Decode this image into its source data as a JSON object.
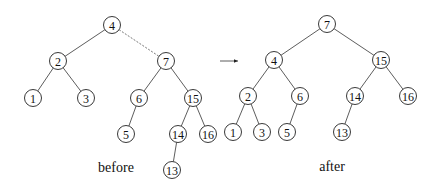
{
  "figure": {
    "node_radius": 8.5,
    "trees": [
      {
        "id": "before",
        "caption": "before",
        "caption_pos": [
          116,
          172
        ],
        "nodes": [
          {
            "key": "4",
            "x": 112,
            "y": 25
          },
          {
            "key": "2",
            "x": 58,
            "y": 61
          },
          {
            "key": "7",
            "x": 166,
            "y": 61
          },
          {
            "key": "1",
            "x": 33,
            "y": 98
          },
          {
            "key": "3",
            "x": 86,
            "y": 98
          },
          {
            "key": "6",
            "x": 139,
            "y": 98
          },
          {
            "key": "15",
            "x": 193,
            "y": 98
          },
          {
            "key": "5",
            "x": 126,
            "y": 134
          },
          {
            "key": "14",
            "x": 178,
            "y": 134
          },
          {
            "key": "16",
            "x": 208,
            "y": 134
          },
          {
            "key": "13",
            "x": 172,
            "y": 170
          }
        ],
        "edges": [
          {
            "from": "4",
            "to": "2",
            "style": "solid"
          },
          {
            "from": "4",
            "to": "7",
            "style": "dashed"
          },
          {
            "from": "2",
            "to": "1",
            "style": "solid"
          },
          {
            "from": "2",
            "to": "3",
            "style": "solid"
          },
          {
            "from": "7",
            "to": "6",
            "style": "solid"
          },
          {
            "from": "7",
            "to": "15",
            "style": "solid"
          },
          {
            "from": "6",
            "to": "5",
            "style": "solid"
          },
          {
            "from": "15",
            "to": "14",
            "style": "solid"
          },
          {
            "from": "15",
            "to": "16",
            "style": "solid"
          },
          {
            "from": "14",
            "to": "13",
            "style": "solid"
          }
        ]
      },
      {
        "id": "after",
        "caption": "after",
        "caption_pos": [
          332,
          171
        ],
        "nodes": [
          {
            "key": "7",
            "x": 327,
            "y": 24
          },
          {
            "key": "4",
            "x": 274,
            "y": 60
          },
          {
            "key": "15",
            "x": 381,
            "y": 60
          },
          {
            "key": "2",
            "x": 248,
            "y": 96
          },
          {
            "key": "6",
            "x": 300,
            "y": 96
          },
          {
            "key": "14",
            "x": 355,
            "y": 96
          },
          {
            "key": "16",
            "x": 408,
            "y": 96
          },
          {
            "key": "1",
            "x": 233,
            "y": 132
          },
          {
            "key": "3",
            "x": 262,
            "y": 132
          },
          {
            "key": "5",
            "x": 287,
            "y": 132
          },
          {
            "key": "13",
            "x": 342,
            "y": 132
          }
        ],
        "edges": [
          {
            "from": "7",
            "to": "4",
            "style": "solid"
          },
          {
            "from": "7",
            "to": "15",
            "style": "solid"
          },
          {
            "from": "4",
            "to": "2",
            "style": "solid"
          },
          {
            "from": "4",
            "to": "6",
            "style": "solid"
          },
          {
            "from": "2",
            "to": "1",
            "style": "solid"
          },
          {
            "from": "2",
            "to": "3",
            "style": "solid"
          },
          {
            "from": "6",
            "to": "5",
            "style": "solid"
          },
          {
            "from": "15",
            "to": "14",
            "style": "solid"
          },
          {
            "from": "15",
            "to": "16",
            "style": "solid"
          },
          {
            "from": "14",
            "to": "13",
            "style": "solid"
          }
        ]
      }
    ],
    "transition_arrow": {
      "from": [
        220,
        61
      ],
      "to": [
        238,
        61
      ],
      "label": ""
    }
  }
}
